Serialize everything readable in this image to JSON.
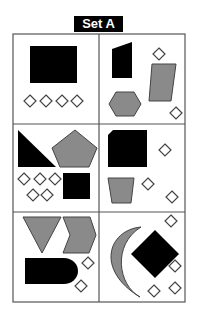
{
  "title": "Set A",
  "colors": {
    "black_fill": "#000000",
    "gray_fill": "#8a8a8a",
    "outline": "#444444",
    "grid_line": "#555555",
    "diamond_fill": "#ffffff"
  },
  "grid": {
    "rows": 3,
    "cols": 2
  },
  "panels": [
    {
      "id": 1,
      "shapes": [
        "black rectangle",
        "4 small white diamonds"
      ]
    },
    {
      "id": 2,
      "shapes": [
        "black quadrilateral",
        "gray parallelogram",
        "gray hexagon",
        "2 small white diamonds"
      ]
    },
    {
      "id": 3,
      "shapes": [
        "black right triangle",
        "gray pentagon",
        "black square",
        "5 small white diamonds"
      ]
    },
    {
      "id": 4,
      "shapes": [
        "black clipped-corner square",
        "gray trapezoid",
        "3 small white diamonds"
      ]
    },
    {
      "id": 5,
      "shapes": [
        "gray inverted triangle",
        "gray chevron",
        "black bullet shape",
        "2 small white diamonds"
      ]
    },
    {
      "id": 6,
      "shapes": [
        "gray crescent",
        "black diamond",
        "4 small white diamonds"
      ]
    }
  ]
}
